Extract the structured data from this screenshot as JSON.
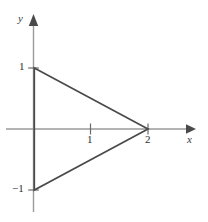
{
  "figure": {
    "background_color": "#ffffff",
    "axis_color": "#9a9a9a",
    "curve_color": "#4a4a4a",
    "text_color": "#2e2e2e"
  },
  "axes": {
    "x_label": "x",
    "y_label": "y",
    "x_ticks": [
      {
        "value": 1,
        "label": "1"
      },
      {
        "value": 2,
        "label": "2"
      }
    ],
    "y_ticks": [
      {
        "value": 1,
        "label": "1"
      },
      {
        "value": -1,
        "label": "−1"
      }
    ]
  },
  "chart_data": {
    "type": "line",
    "title": "",
    "xlabel": "x",
    "ylabel": "y",
    "xlim": [
      -0.6,
      2.8
    ],
    "ylim": [
      -1.85,
      1.85
    ],
    "grid": false,
    "legend": null,
    "series": [
      {
        "name": "triangle",
        "closed": true,
        "fill": "none",
        "stroke": "#4a4a4a",
        "x": [
          0,
          2,
          0,
          0
        ],
        "y": [
          1,
          0,
          -1,
          1
        ]
      }
    ],
    "annotations": [
      {
        "text": "1",
        "x": 0,
        "y": 1,
        "position": "left"
      },
      {
        "text": "−1",
        "x": 0,
        "y": -1,
        "position": "left"
      },
      {
        "text": "1",
        "x": 1,
        "y": 0,
        "position": "below"
      },
      {
        "text": "2",
        "x": 2,
        "y": 0,
        "position": "below"
      }
    ],
    "vertices": [
      {
        "x": 0,
        "y": 1
      },
      {
        "x": 2,
        "y": 0
      },
      {
        "x": 0,
        "y": -1
      }
    ]
  }
}
